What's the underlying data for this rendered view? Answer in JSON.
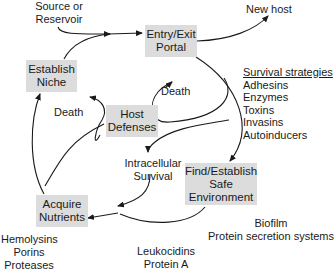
{
  "diagram": {
    "type": "cycle",
    "boxes": {
      "entry_exit": [
        "Entry/Exit",
        "Portal"
      ],
      "establish_niche": [
        "Establish",
        "Niche"
      ],
      "host_defenses": [
        "Host",
        "Defenses"
      ],
      "find_safe_env": [
        "Find/Establish",
        "Safe",
        "Environment"
      ],
      "acquire_nutrients": [
        "Acquire",
        "Nutrients"
      ]
    },
    "labels": {
      "source": [
        "Source or",
        "Reservoir"
      ],
      "new_host": "New host",
      "death_left": "Death",
      "death_right": "Death",
      "intracellular": [
        "Intracellular",
        "Survival"
      ],
      "hemolysins": [
        "Hemolysins",
        "Porins",
        "Proteases"
      ],
      "leukocidins": [
        "Leukocidins",
        "Protein A"
      ],
      "biofilm": [
        "Biofilm",
        "Protein secretion systems"
      ]
    },
    "survival_strategies": {
      "heading": "Survival strategies",
      "items": [
        "Adhesins",
        "Enzymes",
        "Toxins",
        "Invasins",
        "Autoinducers"
      ]
    },
    "colors": {
      "box_fill": "#dcdcdc",
      "line": "#1a1a1a",
      "text": "#1a1a1a"
    }
  }
}
